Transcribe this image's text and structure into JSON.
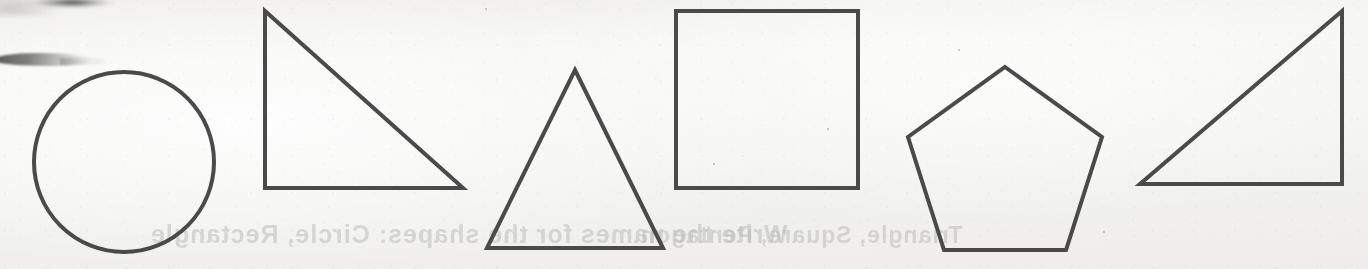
{
  "document": {
    "kind": "scanned-worksheet-strip",
    "background_color": "#f4f4f2",
    "ink_color": "#4a4a4a",
    "stroke_width_px": 4,
    "width_px": 1368,
    "height_px": 269
  },
  "shapes": [
    {
      "id": "circle",
      "name": "Circle",
      "sides": 0,
      "svg_shape": "circle",
      "cx": 124,
      "cy": 162,
      "r": 90
    },
    {
      "id": "right-triangle-left",
      "name": "Right triangle",
      "sides": 3,
      "svg_shape": "polygon",
      "points": "265,11 265,188 463,188"
    },
    {
      "id": "equilateral-triangle",
      "name": "Triangle",
      "sides": 3,
      "svg_shape": "polygon",
      "points": "575,70 663,248 487,248"
    },
    {
      "id": "square",
      "name": "Square",
      "sides": 4,
      "svg_shape": "polygon",
      "points": "676,11 858,11 858,188 676,188"
    },
    {
      "id": "pentagon",
      "name": "Pentagon",
      "sides": 5,
      "svg_shape": "polygon",
      "points": "1005,67 1102,137 1066,250 944,250 908,137"
    },
    {
      "id": "right-triangle-right",
      "name": "Right triangle",
      "sides": 3,
      "svg_shape": "polygon",
      "points": "1342,11 1342,184 1140,184"
    }
  ],
  "ghost_text": {
    "note": "faint mirrored bleed-through from the reverse side of the sheet",
    "lines": [
      {
        "text": "Write the names for the shapes:  Circle, Rectangle",
        "left": 150,
        "top": 8,
        "size": 25,
        "letter_spacing": 1
      },
      {
        "text": "Triangle, Square, Pentagon",
        "left": 640,
        "top": 10,
        "size": 23,
        "letter_spacing": 1
      }
    ]
  },
  "artifacts": {
    "smudge_top_label": "dark scan smudge along top edge",
    "smudge_streak_label": "tapering dark streak near upper-left",
    "specks": [
      {
        "left": 485,
        "top": 8,
        "size": 2
      },
      {
        "left": 827,
        "top": 128,
        "size": 2
      },
      {
        "left": 1103,
        "top": 231,
        "size": 2
      },
      {
        "left": 713,
        "top": 163,
        "size": 2
      },
      {
        "left": 958,
        "top": 49,
        "size": 2
      }
    ]
  }
}
